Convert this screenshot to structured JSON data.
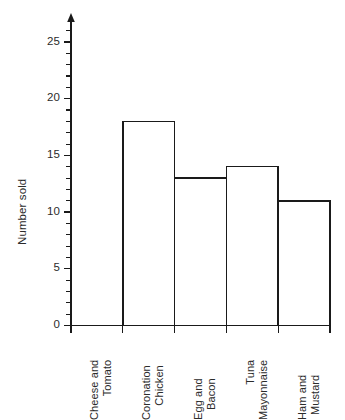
{
  "chart_data": {
    "type": "bar",
    "title": "",
    "subtitle": "",
    "xlabel": "",
    "ylabel": "Number sold",
    "categories": [
      "Cheese and Tomato",
      "Coronation Chicken",
      "Egg and Bacon",
      "Tuna Mayonnaise",
      "Ham and Mustard"
    ],
    "category_lines": [
      [
        "Cheese and",
        "Tomato"
      ],
      [
        "Coronation",
        "Chicken"
      ],
      [
        "Egg and",
        "Bacon"
      ],
      [
        "Tuna",
        "Mayonnaise"
      ],
      [
        "Ham and",
        "Mustard"
      ]
    ],
    "values": [
      24,
      18,
      13,
      14,
      11
    ],
    "ylim": [
      0,
      26
    ],
    "ytick_labels": [
      "0",
      "5",
      "10",
      "15",
      "20",
      "25"
    ],
    "ytick_values": [
      0,
      5,
      10,
      15,
      20,
      25
    ],
    "minor_tick_step": 1,
    "grid": false,
    "legend": null,
    "bar_style": "outline",
    "bar_gap": 0,
    "axis_arrow": "y-axis-up",
    "colors": {
      "bar_fill": "#ffffff",
      "bar_stroke": "#1a1a1a",
      "axis": "#1a1a1a",
      "text": "#2b2b2b",
      "background": "#ffffff"
    }
  }
}
